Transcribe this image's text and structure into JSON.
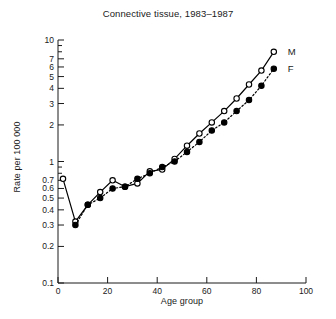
{
  "chart_data": {
    "type": "line",
    "title": "Connective tissue, 1983–1987",
    "xlabel": "Age group",
    "ylabel": "Rate per 100 000",
    "yscale": "log",
    "ylim": [
      0.1,
      10
    ],
    "xlim": [
      0,
      100
    ],
    "grid": false,
    "legend_position": "right",
    "xticks": [
      0,
      20,
      40,
      60,
      80,
      100
    ],
    "xtick_labels": [
      "0",
      "20",
      "40",
      "60",
      "80",
      "100"
    ],
    "yticks": [
      0.1,
      0.2,
      0.3,
      0.4,
      0.5,
      0.6,
      0.7,
      1,
      2,
      3,
      4,
      5,
      6,
      7,
      10
    ],
    "ytick_labels": [
      "0.1",
      "0.2",
      "0.3",
      "0.4",
      "0.5",
      "0.6",
      "0.7",
      "1",
      "2",
      "3",
      "4",
      "5",
      "6",
      "7",
      "10"
    ],
    "series": [
      {
        "name": "M",
        "legend_label": "M",
        "marker": "open-circle",
        "line_style": "solid",
        "color": "#000000",
        "x": [
          2,
          7,
          12,
          17,
          22,
          27,
          32,
          37,
          42,
          47,
          52,
          57,
          62,
          67,
          72,
          77,
          82,
          87
        ],
        "y": [
          0.72,
          0.32,
          0.44,
          0.56,
          0.7,
          0.62,
          0.66,
          0.83,
          0.86,
          1.05,
          1.35,
          1.7,
          2.1,
          2.6,
          3.3,
          4.3,
          5.6,
          8.0
        ]
      },
      {
        "name": "F",
        "legend_label": "F",
        "marker": "filled-circle",
        "line_style": "dotted",
        "color": "#000000",
        "x": [
          7,
          12,
          17,
          22,
          27,
          32,
          37,
          42,
          47,
          52,
          57,
          62,
          67,
          72,
          77,
          82,
          87
        ],
        "y": [
          0.3,
          0.44,
          0.5,
          0.6,
          0.62,
          0.72,
          0.8,
          0.9,
          1.0,
          1.2,
          1.45,
          1.8,
          2.1,
          2.6,
          3.2,
          4.2,
          5.8
        ]
      }
    ]
  },
  "legend": {
    "male": "M",
    "female": "F"
  }
}
